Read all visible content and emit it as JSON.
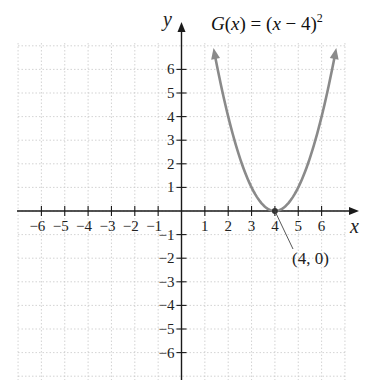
{
  "chart_data": {
    "type": "line",
    "title_parts": {
      "func": "G",
      "var": "x",
      "expr_var": "x",
      "shift": "4",
      "exponent": "2"
    },
    "xlabel": "x",
    "ylabel": "y",
    "xlim": [
      -7,
      7.5
    ],
    "ylim": [
      -7,
      7.5
    ],
    "x_ticks": [
      -6,
      -5,
      -4,
      -3,
      -2,
      -1,
      1,
      2,
      3,
      4,
      5,
      6
    ],
    "y_ticks": [
      6,
      5,
      4,
      3,
      2,
      1,
      -1,
      -2,
      -3,
      -4,
      -5,
      -6
    ],
    "x_tick_labels": [
      "−6",
      "−5",
      "−4",
      "−3",
      "−2",
      "−1",
      "1",
      "2",
      "3",
      "4",
      "5",
      "6"
    ],
    "y_tick_labels": [
      "6",
      "5",
      "4",
      "3",
      "2",
      "1",
      "−1",
      "−2",
      "−3",
      "−4",
      "−5",
      "−6"
    ],
    "grid": true,
    "series": [
      {
        "name": "G(x) = (x − 4)²",
        "function": "(x-4)^2",
        "color": "#8a8a8a",
        "x": [
          1.4,
          2,
          2.5,
          3,
          3.5,
          4,
          4.5,
          5,
          5.5,
          6,
          6.6
        ],
        "y": [
          6.76,
          4,
          2.25,
          1,
          0.25,
          0,
          0.25,
          1,
          2.25,
          4,
          6.76
        ],
        "arrows_both_ends": true
      }
    ],
    "annotations": [
      {
        "text": "(4, 0)",
        "point": [
          4,
          0
        ],
        "label_position": [
          4.8,
          -2
        ]
      }
    ]
  },
  "colors": {
    "axis": "#1a1a1a",
    "curve": "#8a8a8a",
    "grid": "#c8c8c8"
  }
}
